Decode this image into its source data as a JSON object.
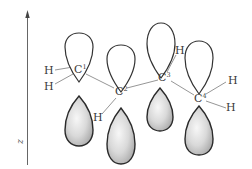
{
  "figure": {
    "axis": {
      "label": "z",
      "direction": "up"
    },
    "carbons": [
      {
        "id": "C1",
        "symbol": "C",
        "index": "1",
        "x": 79,
        "y": 70
      },
      {
        "id": "C2",
        "symbol": "C",
        "index": "2",
        "x": 120,
        "y": 92
      },
      {
        "id": "C3",
        "symbol": "C",
        "index": "3",
        "x": 164,
        "y": 78
      },
      {
        "id": "C4",
        "symbol": "C",
        "index": "4",
        "x": 200,
        "y": 99
      }
    ],
    "hydrogens": [
      {
        "id": "H1a",
        "symbol": "H",
        "bonded_to": "C1"
      },
      {
        "id": "H1b",
        "symbol": "H",
        "bonded_to": "C1"
      },
      {
        "id": "H2",
        "symbol": "H",
        "bonded_to": "C2"
      },
      {
        "id": "H3",
        "symbol": "H",
        "bonded_to": "C3"
      },
      {
        "id": "H4a",
        "symbol": "H",
        "bonded_to": "C4"
      },
      {
        "id": "H4b",
        "symbol": "H",
        "bonded_to": "C4"
      }
    ],
    "orbitals": {
      "type": "p-orbital",
      "upper_lobe_fill": "#ffffff",
      "lower_lobe_fill": "gradient-gray",
      "count": 4
    },
    "colors": {
      "outline": "#333333",
      "bond": "#8a8a8a",
      "text": "#3a3a3a",
      "lobe_shade_light": "#f7f7f7",
      "lobe_shade_dark": "#a8a8a8"
    }
  }
}
